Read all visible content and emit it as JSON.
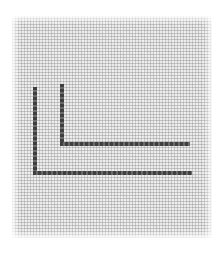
{
  "image": {
    "subject": "fabric swatch with two L-shaped stitched lines",
    "background_color": "#ffffff",
    "fabric_color": "#ebebeb",
    "stitch_color": "#444444"
  },
  "stitches": [
    {
      "name": "inner-l",
      "vertical": {
        "x": 60,
        "y1": 84,
        "y2": 146
      },
      "horizontal": {
        "y": 142,
        "x1": 60,
        "x2": 190
      }
    },
    {
      "name": "outer-l",
      "vertical": {
        "x": 33,
        "y1": 87,
        "y2": 175
      },
      "horizontal": {
        "y": 171,
        "x1": 33,
        "x2": 192
      }
    }
  ]
}
